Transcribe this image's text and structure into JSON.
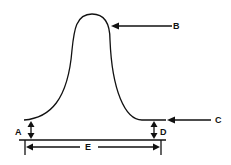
{
  "diagram": {
    "labels": {
      "A": "A",
      "B": "B",
      "C": "C",
      "D": "D",
      "E": "E"
    },
    "colors": {
      "ink": "#111111",
      "background": "#ffffff"
    }
  }
}
